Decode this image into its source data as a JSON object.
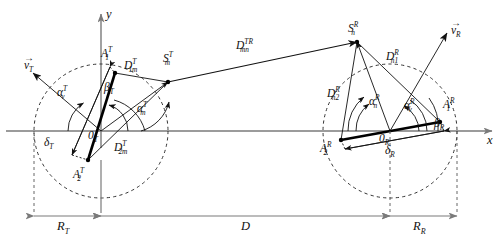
{
  "figure": {
    "type": "geometry-diagram",
    "axes": {
      "x_label": "x",
      "y_label": "y"
    },
    "colors": {
      "stroke": "#111111",
      "dashed_circle": "#333333",
      "axis": "#7a7a7a",
      "bold_antenna_array": "#000000"
    }
  },
  "transmitter": {
    "origin_label": "0",
    "origin_sub": "T",
    "radius_label": "R",
    "radius_sub": "T",
    "velocity_label": "v",
    "velocity_sub": "T",
    "antenna1": {
      "base": "A",
      "sub": "1",
      "sup": "T"
    },
    "antenna2": {
      "base": "A",
      "sub": "2",
      "sup": "T"
    },
    "scatterer": {
      "base": "S",
      "sub": "m",
      "sup": "T"
    },
    "dist1": {
      "base": "D",
      "sub": "1m",
      "sup": "T"
    },
    "dist2": {
      "base": "D",
      "sub": "2m",
      "sup": "T"
    },
    "angle_velocity": {
      "base": "α",
      "sub": "v",
      "sup": "T"
    },
    "angle_scatter": {
      "base": "α",
      "sub": "m",
      "sup": "T"
    },
    "angle_array": {
      "base": "β",
      "sub": "T"
    },
    "spacing": {
      "base": "δ",
      "sub": "T"
    }
  },
  "receiver": {
    "origin_label": "0",
    "origin_sub": "R",
    "radius_label": "R",
    "radius_sub": "R",
    "velocity_label": "v",
    "velocity_sub": "R",
    "antenna1": {
      "base": "A",
      "sub": "1",
      "sup": "R"
    },
    "antenna2": {
      "base": "A",
      "sub": "2",
      "sup": "R"
    },
    "scatterer": {
      "base": "S",
      "sub": "n",
      "sup": "R"
    },
    "dist1": {
      "base": "D",
      "sub": "n1",
      "sup": "R"
    },
    "dist2": {
      "base": "D",
      "sub": "n2",
      "sup": "R"
    },
    "angle_velocity": {
      "base": "α",
      "sub": "v",
      "sup": "R"
    },
    "angle_scatter": {
      "base": "α",
      "sub": "n",
      "sup": "R"
    },
    "angle_array": {
      "base": "β",
      "sub": "R"
    },
    "spacing": {
      "base": "δ",
      "sub": "R"
    }
  },
  "link": {
    "distance_between_scatterers": {
      "base": "D",
      "sub": "mn",
      "sup": "TR"
    },
    "separation": {
      "base": "D",
      "sub": "",
      "sup": ""
    }
  },
  "labels": {
    "y_axis": "y",
    "x_axis": "x",
    "D": "D"
  }
}
